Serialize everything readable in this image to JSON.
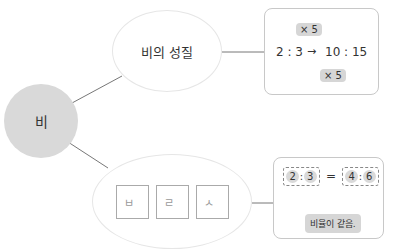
{
  "root": {
    "label": "비"
  },
  "property_node": {
    "label": "비의 성질"
  },
  "keyword_node": {
    "cells": [
      "ㅂ",
      "ㄹ",
      "ㅅ"
    ]
  },
  "example1": {
    "left": {
      "a": "2",
      "colon": ":",
      "b": "3"
    },
    "arrow": "→",
    "right": {
      "a": "10",
      "colon": ":",
      "b": "15"
    },
    "top_multiplier": "× 5",
    "bottom_multiplier": "× 5"
  },
  "example2": {
    "left": {
      "a": "2",
      "colon": ":",
      "b": "3"
    },
    "equals": "=",
    "right": {
      "a": "4",
      "colon": ":",
      "b": "6"
    },
    "caption": "비율이 같음."
  },
  "colors": {
    "root_fill": "#d9d9d9",
    "highlight": "#d6d6d6",
    "border": "#c8c8c8"
  }
}
